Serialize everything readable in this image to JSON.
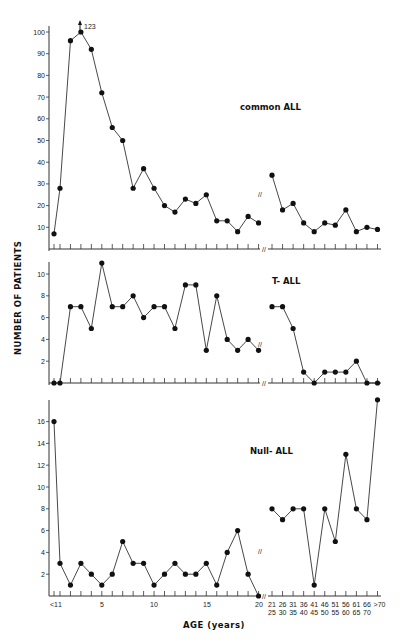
{
  "chart_data": [
    {
      "type": "line",
      "title": "common ALL",
      "ylabel": "NUMBER OF PATIENTS",
      "xlabel": "AGE (years)",
      "ylim": [
        0,
        100
      ],
      "yticks": [
        10,
        20,
        30,
        40,
        50,
        60,
        70,
        80,
        90,
        100
      ],
      "annotation": "123",
      "segments": [
        {
          "x": [
            "<1",
            "1",
            "2",
            "3",
            "4",
            "5",
            "6",
            "7",
            "8",
            "9",
            "10",
            "11",
            "12",
            "13",
            "14",
            "15",
            "16",
            "17",
            "18",
            "19",
            "20"
          ],
          "values": [
            7,
            28,
            96,
            123,
            92,
            72,
            56,
            50,
            28,
            37,
            28,
            20,
            17,
            23,
            21,
            25,
            13,
            13,
            8,
            15,
            12
          ]
        },
        {
          "x": [
            "21-25",
            "26-30",
            "31-35",
            "36-40",
            "41-45",
            "46-50",
            "51-55",
            "56-60",
            "61-65",
            "66-70",
            ">70"
          ],
          "values": [
            34,
            18,
            21,
            12,
            8,
            12,
            11,
            18,
            8,
            10,
            9
          ]
        }
      ]
    },
    {
      "type": "line",
      "title": "T- ALL",
      "ylim": [
        0,
        11
      ],
      "yticks": [
        2,
        4,
        6,
        8,
        10
      ],
      "segments": [
        {
          "x": [
            "<1",
            "1",
            "2",
            "3",
            "4",
            "5",
            "6",
            "7",
            "8",
            "9",
            "10",
            "11",
            "12",
            "13",
            "14",
            "15",
            "16",
            "17",
            "18",
            "19",
            "20"
          ],
          "values": [
            0,
            0,
            7,
            7,
            5,
            11,
            7,
            7,
            8,
            6,
            7,
            7,
            5,
            9,
            9,
            3,
            8,
            4,
            3,
            4,
            3
          ]
        },
        {
          "x": [
            "21-25",
            "26-30",
            "31-35",
            "36-40",
            "41-45",
            "46-50",
            "51-55",
            "56-60",
            "61-65",
            "66-70",
            ">70"
          ],
          "values": [
            7,
            7,
            5,
            1,
            0,
            1,
            1,
            1,
            2,
            0,
            0
          ]
        }
      ]
    },
    {
      "type": "line",
      "title": "Null- ALL",
      "ylim": [
        0,
        17
      ],
      "yticks": [
        2,
        4,
        6,
        8,
        10,
        12,
        14,
        16
      ],
      "segments": [
        {
          "x": [
            "<1",
            "1",
            "2",
            "3",
            "4",
            "5",
            "6",
            "7",
            "8",
            "9",
            "10",
            "11",
            "12",
            "13",
            "14",
            "15",
            "16",
            "17",
            "18",
            "19",
            "20"
          ],
          "values": [
            16,
            3,
            1,
            3,
            2,
            1,
            2,
            5,
            3,
            3,
            1,
            2,
            3,
            2,
            2,
            3,
            1,
            4,
            6,
            2,
            0
          ]
        },
        {
          "x": [
            "21-25",
            "26-30",
            "31-35",
            "36-40",
            "41-45",
            "46-50",
            "51-55",
            "56-60",
            "61-65",
            "66-70",
            ">70"
          ],
          "values": [
            8,
            7,
            8,
            8,
            1,
            8,
            5,
            13,
            8,
            7,
            18
          ]
        }
      ]
    }
  ],
  "labels": {
    "ylabel": "NUMBER OF PATIENTS",
    "xlabel": "AGE (years)",
    "panel1": "common ALL",
    "panel2": "T- ALL",
    "panel3": "Null- ALL",
    "peak_annotation": "123"
  },
  "xticks_top": [
    "<1",
    "1",
    "5",
    "10",
    "15",
    "20"
  ],
  "xticks_groups": [
    {
      "top": "21",
      "bottom": "25"
    },
    {
      "top": "26",
      "bottom": "30"
    },
    {
      "top": "31",
      "bottom": "35"
    },
    {
      "top": "36",
      "bottom": "40"
    },
    {
      "top": "41",
      "bottom": "45"
    },
    {
      "top": "46",
      "bottom": "50"
    },
    {
      "top": "51",
      "bottom": "55"
    },
    {
      "top": "56",
      "bottom": "60"
    },
    {
      "top": "61",
      "bottom": "65"
    },
    {
      "top": "66",
      "bottom": "70"
    },
    {
      "top": ">70",
      "bottom": ""
    }
  ]
}
